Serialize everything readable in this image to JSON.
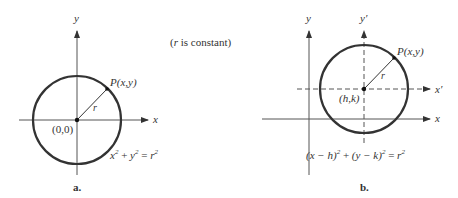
{
  "note": "(r is constant)",
  "figure_a": {
    "caption": "a.",
    "y_axis_label": "y",
    "x_axis_label": "x",
    "point_label": "P(x,y)",
    "radius_label": "r",
    "center_label": "(0,0)",
    "equation": {
      "part1": "x",
      "sup1": "2",
      "plus": " + ",
      "part2": "y",
      "sup2": "2",
      "eq": " = ",
      "part3": "r",
      "sup3": "2"
    }
  },
  "figure_b": {
    "caption": "b.",
    "y_axis_label": "y",
    "x_axis_label": "x",
    "y_prime_label": "y′",
    "x_prime_label": "x′",
    "point_label": "P(x,y)",
    "radius_label": "r",
    "center_label": "(h,k)",
    "equation": {
      "t1": "(x − h)",
      "sup1": "2",
      "plus": " + ",
      "t2": "(y − k)",
      "sup2": "2",
      "eq": " = ",
      "t3": "r",
      "sup3": "2"
    }
  },
  "colors": {
    "circle": "#333333",
    "axis": "#555555",
    "text": "#333333"
  }
}
